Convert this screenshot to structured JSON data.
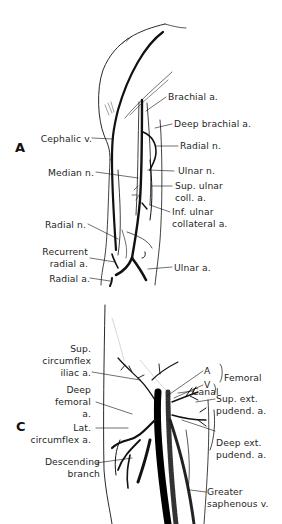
{
  "figure": {
    "panels": [
      {
        "id": "A",
        "letter": "A",
        "labels": {
          "brachial_a": "Brachial a.",
          "deep_brachial_a": "Deep brachial a.",
          "radial_n_upper": "Radial n.",
          "cephalic_v": "Cephalic v.",
          "median_n": "Median n.",
          "ulnar_n": "Ulnar n.",
          "sup_ulnar_coll_a_1": "Sup. ulnar",
          "sup_ulnar_coll_a_2": "coll. a.",
          "inf_ulnar_collateral_a_1": "Inf. ulnar",
          "inf_ulnar_collateral_a_2": "collateral a.",
          "radial_n_lower": "Radial n.",
          "recurrent_radial_a_1": "Recurrent",
          "recurrent_radial_a_2": "radial a.",
          "radial_a": "Radial a.",
          "ulnar_a": "Ulnar a."
        }
      },
      {
        "id": "C",
        "letter": "C",
        "labels": {
          "sup_circumflex_iliac_a_1": "Sup.",
          "sup_circumflex_iliac_a_2": "circumflex",
          "sup_circumflex_iliac_a_3": "iliac a.",
          "deep_femoral_a_1": "Deep",
          "deep_femoral_a_2": "femoral",
          "deep_femoral_a_3": "a.",
          "lat_circumflex_a_1": "Lat.",
          "lat_circumflex_a_2": "circumflex a.",
          "descending_branch_1": "Descending",
          "descending_branch_2": "branch",
          "a": "A",
          "v": "V",
          "canal": "Canal",
          "femoral": "Femoral",
          "sup_ext_pudend_a_1": "Sup. ext.",
          "sup_ext_pudend_a_2": "pudend. a.",
          "deep_ext_pudend_a_1": "Deep ext.",
          "deep_ext_pudend_a_2": "pudend. a.",
          "greater_saphenous_v_1": "Greater",
          "greater_saphenous_v_2": "saphenous v."
        }
      }
    ]
  }
}
